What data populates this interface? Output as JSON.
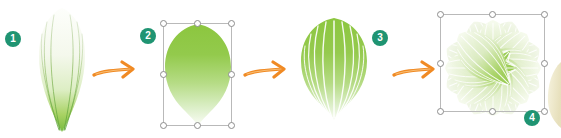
{
  "scene": {
    "title": "Leaf to rosette construction steps",
    "background_color": "#ffffff",
    "width": 561,
    "height": 138
  },
  "palette": {
    "badge_fill": "#1f9472",
    "badge_text": "#ffffff",
    "arrow_color": "#f08a24",
    "arrow_color_light": "#f6a94a",
    "leaf_green_bright": "#8cc63f",
    "leaf_green_mid": "#a9d45e",
    "leaf_green_pale": "#d8e8b4",
    "leaf_vein_white": "#ffffff",
    "leaf_vein_green": "#7ab648",
    "leaf_white": "#fbfdf8",
    "selection_box_stroke": "#b9b9b9",
    "handle_fill": "#ffffff",
    "handle_stroke": "#8d8d8d",
    "cream_object": "#efe9c9"
  },
  "steps": [
    {
      "number": "1",
      "badge_name": "step-badge-1",
      "artwork_name": "single-narrow-leaf",
      "description": "Narrow elongated pale leaf with thin green veins converging to a pointed green tip",
      "selected": false
    },
    {
      "number": "2",
      "badge_name": "step-badge-2",
      "artwork_name": "solid-green-leaf-shape",
      "description": "Solid rounded leaf silhouette filled with green-to-white vertical gradient",
      "selected": true
    },
    {
      "number": "3",
      "badge_name": "step-badge-3",
      "artwork_name": "veined-green-leaf",
      "description": "Rounded green leaf with white radiating vein lines",
      "selected": false
    },
    {
      "number": "4",
      "badge_name": "step-badge-4",
      "artwork_name": "leaf-rosette",
      "description": "Eight leaves rotated around a center point forming a rosette flower",
      "selected": true
    }
  ],
  "arrows": [
    {
      "name": "arrow-step-1-to-2",
      "label": "next step"
    },
    {
      "name": "arrow-step-2-to-3",
      "label": "next step"
    },
    {
      "name": "arrow-step-3-to-4",
      "label": "next step"
    }
  ],
  "partial_object": {
    "name": "adjacent-cream-shape",
    "description": "Partially visible cream colored shape cropped at the right edge"
  }
}
